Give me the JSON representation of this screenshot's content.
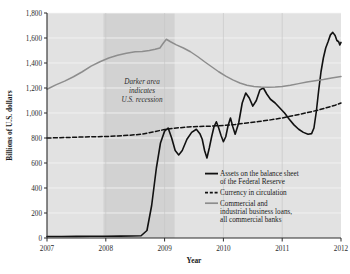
{
  "chart_data": {
    "type": "line",
    "title": "",
    "xlabel": "Year",
    "ylabel": "Billions of U.S. dollars",
    "xlim": [
      2007,
      2012
    ],
    "ylim": [
      0,
      1800
    ],
    "xticks": [
      "2007",
      "2008",
      "2009",
      "2010",
      "2011",
      "2012"
    ],
    "yticks": [
      "0",
      "200",
      "400",
      "600",
      "800",
      "1,000",
      "1,200",
      "1,400",
      "1,600",
      "1,800"
    ],
    "grid": "horizontal-and-vertical-light",
    "legend_position": "inside-lower-right",
    "plot_background": "#e2e2e2",
    "recession_band": {
      "label_lines": [
        "Darker area",
        "indicates",
        "U.S. recession"
      ],
      "start": 2007.96,
      "end": 2009.17,
      "color": "#d2d2d2"
    },
    "series": [
      {
        "name": "Assets on the balance sheet of the Federal Reserve",
        "legend_label_lines": [
          "Assets on the balance sheet",
          "of the Federal Reserve"
        ],
        "style": "solid",
        "color": "#111111",
        "width": 1.6,
        "points": [
          [
            2007.0,
            12
          ],
          [
            2007.25,
            12
          ],
          [
            2007.5,
            13
          ],
          [
            2007.75,
            14
          ],
          [
            2008.0,
            14
          ],
          [
            2008.25,
            15
          ],
          [
            2008.45,
            16
          ],
          [
            2008.6,
            18
          ],
          [
            2008.7,
            60
          ],
          [
            2008.78,
            260
          ],
          [
            2008.86,
            560
          ],
          [
            2008.93,
            760
          ],
          [
            2009.0,
            855
          ],
          [
            2009.06,
            880
          ],
          [
            2009.12,
            800
          ],
          [
            2009.18,
            700
          ],
          [
            2009.24,
            665
          ],
          [
            2009.3,
            700
          ],
          [
            2009.38,
            790
          ],
          [
            2009.46,
            845
          ],
          [
            2009.54,
            870
          ],
          [
            2009.6,
            835
          ],
          [
            2009.64,
            790
          ],
          [
            2009.68,
            700
          ],
          [
            2009.72,
            640
          ],
          [
            2009.76,
            720
          ],
          [
            2009.8,
            810
          ],
          [
            2009.84,
            890
          ],
          [
            2009.88,
            930
          ],
          [
            2009.92,
            880
          ],
          [
            2009.96,
            820
          ],
          [
            2010.0,
            770
          ],
          [
            2010.04,
            810
          ],
          [
            2010.08,
            900
          ],
          [
            2010.12,
            960
          ],
          [
            2010.16,
            890
          ],
          [
            2010.2,
            830
          ],
          [
            2010.26,
            920
          ],
          [
            2010.32,
            1080
          ],
          [
            2010.38,
            1160
          ],
          [
            2010.44,
            1120
          ],
          [
            2010.5,
            1055
          ],
          [
            2010.56,
            1100
          ],
          [
            2010.62,
            1185
          ],
          [
            2010.68,
            1200
          ],
          [
            2010.74,
            1150
          ],
          [
            2010.8,
            1110
          ],
          [
            2010.88,
            1080
          ],
          [
            2010.96,
            1040
          ],
          [
            2011.04,
            1000
          ],
          [
            2011.12,
            950
          ],
          [
            2011.2,
            905
          ],
          [
            2011.28,
            870
          ],
          [
            2011.36,
            845
          ],
          [
            2011.44,
            830
          ],
          [
            2011.5,
            835
          ],
          [
            2011.54,
            880
          ],
          [
            2011.58,
            1010
          ],
          [
            2011.62,
            1180
          ],
          [
            2011.66,
            1330
          ],
          [
            2011.7,
            1440
          ],
          [
            2011.74,
            1520
          ],
          [
            2011.78,
            1570
          ],
          [
            2011.82,
            1625
          ],
          [
            2011.86,
            1645
          ],
          [
            2011.9,
            1620
          ],
          [
            2011.93,
            1580
          ],
          [
            2011.96,
            1570
          ],
          [
            2011.98,
            1545
          ],
          [
            2012.0,
            1565
          ]
        ]
      },
      {
        "name": "Currency in circulation",
        "legend_label_lines": [
          "Currency in circulation"
        ],
        "style": "dashed",
        "color": "#111111",
        "width": 1.5,
        "points": [
          [
            2007.0,
            800
          ],
          [
            2007.2,
            802
          ],
          [
            2007.4,
            805
          ],
          [
            2007.6,
            808
          ],
          [
            2007.8,
            810
          ],
          [
            2008.0,
            812
          ],
          [
            2008.2,
            816
          ],
          [
            2008.4,
            822
          ],
          [
            2008.6,
            830
          ],
          [
            2008.8,
            848
          ],
          [
            2009.0,
            868
          ],
          [
            2009.2,
            880
          ],
          [
            2009.4,
            888
          ],
          [
            2009.6,
            892
          ],
          [
            2009.8,
            895
          ],
          [
            2010.0,
            900
          ],
          [
            2010.2,
            908
          ],
          [
            2010.4,
            920
          ],
          [
            2010.6,
            932
          ],
          [
            2010.8,
            945
          ],
          [
            2011.0,
            960
          ],
          [
            2011.2,
            980
          ],
          [
            2011.4,
            1000
          ],
          [
            2011.6,
            1022
          ],
          [
            2011.8,
            1048
          ],
          [
            2011.9,
            1062
          ],
          [
            2012.0,
            1080
          ]
        ]
      },
      {
        "name": "Commercial and industrial business loans, all commercial banks",
        "legend_label_lines": [
          "Commercial and",
          "industrial business loans,",
          "all commercial banks"
        ],
        "style": "solid",
        "color": "#8d8d8d",
        "width": 1.5,
        "points": [
          [
            2007.0,
            1190
          ],
          [
            2007.15,
            1225
          ],
          [
            2007.3,
            1255
          ],
          [
            2007.45,
            1290
          ],
          [
            2007.6,
            1330
          ],
          [
            2007.75,
            1375
          ],
          [
            2007.9,
            1410
          ],
          [
            2008.05,
            1440
          ],
          [
            2008.2,
            1462
          ],
          [
            2008.35,
            1478
          ],
          [
            2008.5,
            1490
          ],
          [
            2008.62,
            1492
          ],
          [
            2008.74,
            1500
          ],
          [
            2008.84,
            1510
          ],
          [
            2008.92,
            1520
          ],
          [
            2008.98,
            1560
          ],
          [
            2009.03,
            1590
          ],
          [
            2009.1,
            1570
          ],
          [
            2009.2,
            1545
          ],
          [
            2009.32,
            1520
          ],
          [
            2009.44,
            1490
          ],
          [
            2009.56,
            1452
          ],
          [
            2009.68,
            1410
          ],
          [
            2009.8,
            1370
          ],
          [
            2009.92,
            1330
          ],
          [
            2010.04,
            1295
          ],
          [
            2010.16,
            1265
          ],
          [
            2010.28,
            1240
          ],
          [
            2010.4,
            1222
          ],
          [
            2010.52,
            1212
          ],
          [
            2010.64,
            1208
          ],
          [
            2010.76,
            1206
          ],
          [
            2010.88,
            1208
          ],
          [
            2011.0,
            1212
          ],
          [
            2011.14,
            1222
          ],
          [
            2011.28,
            1235
          ],
          [
            2011.42,
            1248
          ],
          [
            2011.56,
            1258
          ],
          [
            2011.7,
            1268
          ],
          [
            2011.84,
            1280
          ],
          [
            2012.0,
            1292
          ]
        ]
      }
    ]
  },
  "legend": {
    "items": [
      {
        "marker": "solid-black",
        "lines": [
          "Assets on the balance sheet",
          "of the Federal Reserve"
        ]
      },
      {
        "marker": "dashed-black",
        "lines": [
          "Currency in circulation"
        ]
      },
      {
        "marker": "solid-gray",
        "lines": [
          "Commercial and",
          "industrial business loans,",
          "all commercial banks"
        ]
      }
    ]
  }
}
